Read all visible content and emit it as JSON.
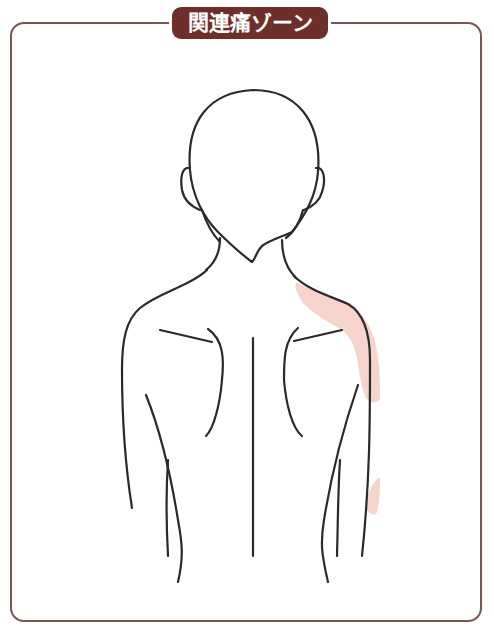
{
  "title": "関連痛ゾーン",
  "colors": {
    "frame": "#7a5552",
    "badge": "#6e2f2a",
    "badge_text": "#ffffff",
    "pain_zone": "#f6d3cb",
    "line": "#2a2a2a"
  },
  "figure": {
    "highlighted_zones": [
      "right-shoulder-to-upper-arm",
      "right-lateral-forearm-spot"
    ]
  }
}
